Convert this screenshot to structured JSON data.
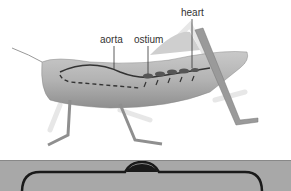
{
  "diagram": {
    "labels": {
      "aorta": "aorta",
      "ostium": "ostium",
      "heart": "heart"
    }
  },
  "panel": {
    "color": "#a8a8a8"
  }
}
